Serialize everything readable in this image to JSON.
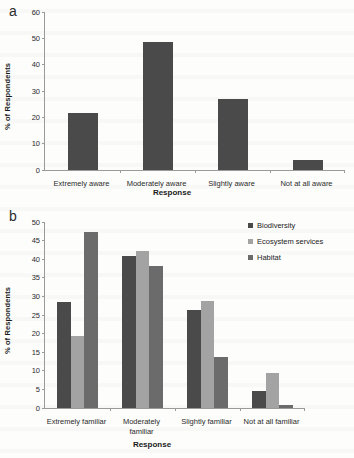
{
  "figure": {
    "background_color": "#fdfdfc",
    "axis_color": "#9a9a9a",
    "text_color": "#2b2b2b"
  },
  "panels": {
    "a": {
      "letter": "a"
    },
    "b": {
      "letter": "b"
    }
  },
  "series_colors": {
    "single": "#4a4a4a",
    "biodiversity": "#4a4a4a",
    "ecosystem_services": "#a3a3a3",
    "habitat": "#6b6b6b"
  },
  "legend": {
    "items": [
      {
        "label": "Biodiversity",
        "color": "#4a4a4a"
      },
      {
        "label": "Ecosystem services",
        "color": "#a3a3a3"
      },
      {
        "label": "Habitat",
        "color": "#6b6b6b"
      }
    ]
  },
  "chart_data": [
    {
      "type": "bar",
      "panel": "a",
      "title": "",
      "xlabel": "Response",
      "ylabel": "% of Respondents",
      "categories": [
        "Extremely aware",
        "Moderately aware",
        "Slightly aware",
        "Not at all aware"
      ],
      "values": [
        21.8,
        48.7,
        27.1,
        3.9
      ],
      "ylim": [
        0,
        60
      ],
      "yticks": [
        0,
        10,
        20,
        30,
        40,
        50,
        60
      ],
      "ytick_labels": [
        "0",
        "10",
        "20",
        "30",
        "40",
        "50",
        "60"
      ],
      "grid": false,
      "legend": "none",
      "bar_color": "#4a4a4a"
    },
    {
      "type": "bar",
      "panel": "b",
      "title": "",
      "xlabel": "Response",
      "ylabel": "% of Respondents",
      "categories": [
        "Extremely familiar",
        "Moderately familiar",
        "Slightly familiar",
        "Not at all familiar"
      ],
      "category_lines": [
        [
          "Extremely familiar"
        ],
        [
          "Moderately",
          "familiar"
        ],
        [
          "Slightly familiar"
        ],
        [
          "Not at all familiar"
        ]
      ],
      "series": [
        {
          "name": "Biodiversity",
          "color": "#4a4a4a",
          "values": [
            28.5,
            40.9,
            26.3,
            4.5
          ]
        },
        {
          "name": "Ecosystem services",
          "color": "#a3a3a3",
          "values": [
            19.3,
            42.3,
            28.9,
            9.5
          ]
        },
        {
          "name": "Habitat",
          "color": "#6b6b6b",
          "values": [
            47.3,
            38.2,
            13.7,
            0.8
          ]
        }
      ],
      "ylim": [
        0,
        50
      ],
      "yticks": [
        0,
        5,
        10,
        15,
        20,
        25,
        30,
        35,
        40,
        45,
        50
      ],
      "ytick_labels": [
        "0",
        "5",
        "10",
        "15",
        "20",
        "25",
        "30",
        "35",
        "40",
        "45",
        "50"
      ],
      "grid": false,
      "legend": "upper right"
    }
  ]
}
